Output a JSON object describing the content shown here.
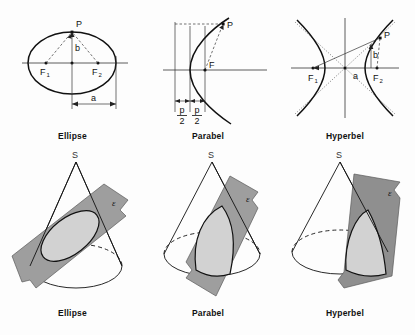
{
  "top_figures": [
    {
      "id": "ellipse-2d",
      "caption": "Ellipse",
      "labels": {
        "point": "P",
        "focus1": "F",
        "focus1_sub": "1",
        "focus2": "F",
        "focus2_sub": "2",
        "semi_minor": "b",
        "semi_major": "a"
      }
    },
    {
      "id": "parabola-2d",
      "caption": "Parabel",
      "labels": {
        "point": "P",
        "focus": "F",
        "param_numerator": "p",
        "param_denominator": "2"
      }
    },
    {
      "id": "hyperbola-2d",
      "caption": "Hyperbel",
      "labels": {
        "point": "P",
        "focus1": "F",
        "focus1_sub": "1",
        "focus2": "F",
        "focus2_sub": "2",
        "semi_minor": "b",
        "semi_major": "a"
      }
    }
  ],
  "bottom_figures": [
    {
      "id": "ellipse-3d",
      "caption": "Ellipse",
      "apex": "S",
      "plane": "ε"
    },
    {
      "id": "parabola-3d",
      "caption": "Parabel",
      "apex": "S",
      "plane": "ε"
    },
    {
      "id": "hyperbola-3d",
      "caption": "Hyperbel",
      "apex": "S",
      "plane": "ε"
    }
  ],
  "colors": {
    "background": "#fdfdfd",
    "ink": "#111111",
    "plane_fill": "#9e9e9e",
    "section_fill": "#d2d2d2",
    "axis": "#333333"
  }
}
